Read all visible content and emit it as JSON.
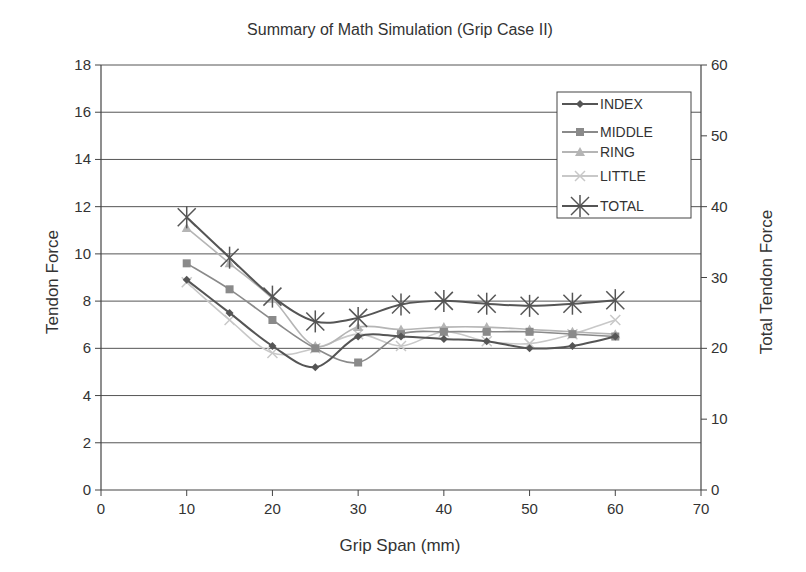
{
  "chart_data": {
    "type": "line",
    "title": "Summary of Math Simulation (Grip Case II)",
    "xlabel": "Grip Span (mm)",
    "ylabel": "Tendon Force",
    "y2label": "Total Tendon Force",
    "xlim": [
      0,
      70
    ],
    "ylim": [
      0,
      18
    ],
    "y2lim": [
      0,
      60
    ],
    "xticks": [
      0,
      10,
      20,
      30,
      40,
      50,
      60,
      70
    ],
    "yticks": [
      0,
      2,
      4,
      6,
      8,
      10,
      12,
      14,
      16,
      18
    ],
    "y2ticks": [
      0,
      10,
      20,
      30,
      40,
      50,
      60
    ],
    "grid": true,
    "legend_position": "upper right",
    "x": [
      10,
      15,
      20,
      25,
      30,
      35,
      40,
      45,
      50,
      55,
      60
    ],
    "series": [
      {
        "name": "INDEX",
        "axis": "left",
        "marker": "diamond",
        "color": "#555555",
        "values": [
          8.9,
          7.5,
          6.1,
          5.2,
          6.5,
          6.5,
          6.4,
          6.3,
          6.0,
          6.1,
          6.5
        ]
      },
      {
        "name": "MIDDLE",
        "axis": "left",
        "marker": "square",
        "color": "#8a8a8a",
        "values": [
          9.6,
          8.5,
          7.2,
          6.0,
          5.4,
          6.6,
          6.7,
          6.7,
          6.7,
          6.6,
          6.5
        ]
      },
      {
        "name": "RING",
        "axis": "left",
        "marker": "triangle",
        "color": "#b5b5b5",
        "values": [
          11.1,
          9.6,
          8.1,
          6.1,
          6.9,
          6.8,
          6.9,
          6.9,
          6.8,
          6.7,
          6.6
        ]
      },
      {
        "name": "LITTLE",
        "axis": "left",
        "marker": "x",
        "color": "#c8c8c8",
        "values": [
          8.8,
          7.2,
          5.8,
          6.0,
          6.6,
          6.1,
          6.7,
          6.3,
          6.2,
          6.6,
          7.2
        ]
      },
      {
        "name": "TOTAL",
        "axis": "right",
        "marker": "star",
        "color": "#555555",
        "values": [
          38.5,
          32.8,
          27.3,
          23.8,
          24.3,
          26.2,
          26.7,
          26.3,
          26.0,
          26.3,
          26.8
        ]
      }
    ]
  }
}
